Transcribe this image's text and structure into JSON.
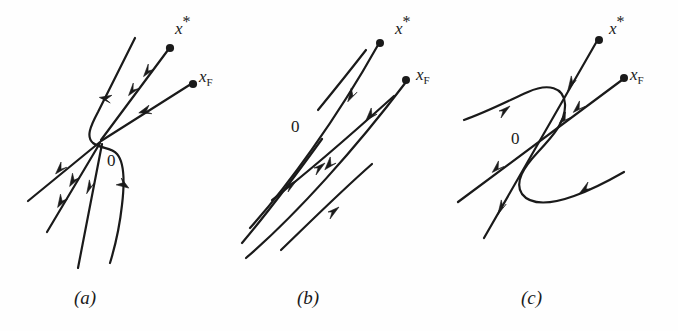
{
  "figure": {
    "background_color": "#fefefe",
    "ink_color": "#1a1a1a",
    "panel_count": 3
  },
  "panels": [
    {
      "id": "a",
      "caption": "(a)",
      "caption_pos": {
        "x": 74,
        "y": 288
      },
      "origin": {
        "label": "0",
        "x": 107,
        "y": 152,
        "point_x": 101,
        "point_y": 140
      },
      "endpoint_labels": [
        {
          "name": "x-star",
          "base": "x",
          "sup": "*",
          "sub": "",
          "label_x": 175,
          "label_y": 20,
          "dot_x": 170,
          "dot_y": 48
        },
        {
          "name": "x-f",
          "base": "x",
          "sup": "",
          "sub": "F",
          "label_x": 199,
          "label_y": 68,
          "dot_x": 193,
          "dot_y": 84
        }
      ],
      "description": "Saddle-node: trajectories approach the fixed point 0 from the lower-left along straight lines, a hooked curve turns around the origin, and two straight trajectories leave toward x* and x_F."
    },
    {
      "id": "b",
      "caption": "(b)",
      "caption_pos": {
        "x": 297,
        "y": 288
      },
      "origin": {
        "label": "0",
        "x": 291,
        "y": 118,
        "point_x": 310,
        "point_y": 144
      },
      "endpoint_labels": [
        {
          "name": "x-star",
          "base": "x",
          "sup": "*",
          "sub": "",
          "label_x": 395,
          "label_y": 20,
          "dot_x": 380,
          "dot_y": 43
        },
        {
          "name": "x-f",
          "base": "x",
          "sup": "",
          "sub": "F",
          "label_x": 416,
          "label_y": 66,
          "dot_x": 406,
          "dot_y": 80
        }
      ],
      "description": "Four nearly parallel trajectories of two slightly different slopes crossing near 0; two flow up-right to x* and x_F, two flow down-left."
    },
    {
      "id": "c",
      "caption": "(c)",
      "caption_pos": {
        "x": 521,
        "y": 288
      },
      "origin": {
        "label": "0",
        "x": 511,
        "y": 130,
        "point_x": 530,
        "point_y": 145
      },
      "endpoint_labels": [
        {
          "name": "x-star",
          "base": "x",
          "sup": "*",
          "sub": "",
          "label_x": 609,
          "label_y": 20,
          "dot_x": 588,
          "dot_y": 41
        },
        {
          "name": "x-f",
          "base": "x",
          "sup": "",
          "sub": "F",
          "label_x": 630,
          "label_y": 66,
          "dot_x": 613,
          "dot_y": 80
        }
      ],
      "description": "An S-shaped (hooked) separatrix crosses two straight trajectories at 0; the upper hook flows to the upper-left, the lower hook flows to the lower-right."
    }
  ]
}
